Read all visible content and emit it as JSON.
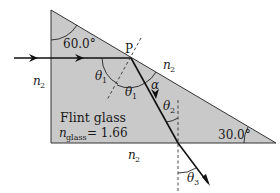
{
  "diagram": {
    "type": "prism-refraction",
    "colors": {
      "glass_fill": "#c9c9c9",
      "stroke": "#222222",
      "background": "#ffffff"
    },
    "prism": {
      "vertices": {
        "top": [
          51,
          10
        ],
        "bottom_left": [
          51,
          143
        ],
        "bottom_right": [
          276,
          143
        ]
      },
      "top_angle_label": "60.0°",
      "right_angle_label": "30.0°"
    },
    "material": {
      "name": "Flint glass",
      "index_symbol": "n",
      "index_subscript": "glass",
      "index_value": "= 1.66"
    },
    "medium_labels": {
      "symbol": "n",
      "subscript": "2"
    },
    "point_label": "P",
    "angles": {
      "theta": "θ",
      "theta1_sub": "1",
      "theta2_sub": "2",
      "theta3_sub": "3",
      "alpha": "α"
    }
  }
}
